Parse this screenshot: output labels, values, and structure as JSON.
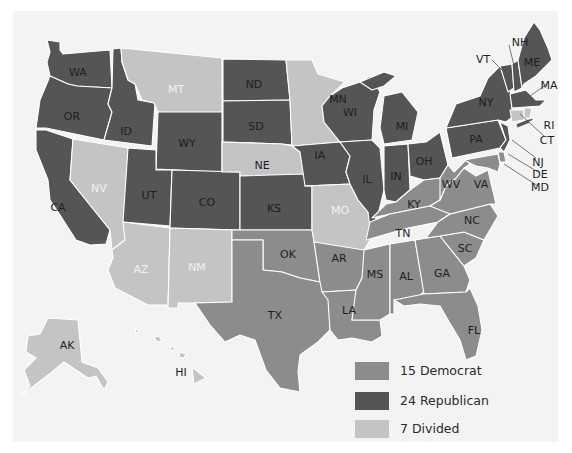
{
  "colors": {
    "democrat": "#8c8c8c",
    "republican": "#555555",
    "divided": "#c4c4c4",
    "panel": "#f3f3f3",
    "label_dark": "#1e1e1e",
    "label_light": "#f2f2f2"
  },
  "legend": {
    "items": [
      {
        "key": "democrat",
        "label": "15 Democrat",
        "color": "#8c8c8c"
      },
      {
        "key": "republican",
        "label": "24 Republican",
        "color": "#555555"
      },
      {
        "key": "divided",
        "label": "7 Divided",
        "color": "#c4c4c4"
      }
    ]
  },
  "states": [
    {
      "abbr": "WA",
      "party": "republican",
      "poly": "47,40 60,42 60,50 63,54 110,50 112,88 77,86 68,84 50,76 47,62 50,52",
      "lx": 78,
      "ly": 72
    },
    {
      "abbr": "OR",
      "party": "republican",
      "poly": "50,76 68,84 77,86 112,88 108,104 112,112 104,140 46,128 36,128 40,100",
      "lx": 72,
      "ly": 115
    },
    {
      "abbr": "CA",
      "party": "republican",
      "poly": "36,130 46,130 73,139 70,180 110,230 106,244 90,245 76,240 60,215 50,200 48,180 40,160 36,150",
      "lx": 58,
      "ly": 207
    },
    {
      "abbr": "ID",
      "party": "republican",
      "poly": "113,49 121,48 122,62 128,80 135,84 138,100 155,103 152,146 104,140 112,112 108,104 112,88",
      "lx": 124,
      "ly": 131
    },
    {
      "abbr": "NV",
      "party": "divided",
      "poly": "73,139 128,148 125,240 112,250 110,230 70,180",
      "lx": 98,
      "ly": 188
    },
    {
      "abbr": "MT",
      "party": "divided",
      "poly": "121,48 222,58 222,118 158,112 154,103 142,100 135,84 128,80 122,62",
      "lx": 176,
      "ly": 88
    },
    {
      "abbr": "WY",
      "party": "republican",
      "poly": "158,112 222,112 222,172 156,169",
      "lx": 186,
      "ly": 142
    },
    {
      "abbr": "UT",
      "party": "republican",
      "poly": "128,148 156,150 156,170 172,170 170,226 123,222",
      "lx": 149,
      "ly": 194
    },
    {
      "abbr": "CO",
      "party": "republican",
      "poly": "172,170 240,172 240,230 170,228",
      "lx": 205,
      "ly": 202
    },
    {
      "abbr": "AZ",
      "party": "divided",
      "poly": "123,222 170,228 168,305 148,305 115,288 108,270 113,258 112,250 125,240",
      "lx": 140,
      "ly": 268
    },
    {
      "abbr": "NM",
      "party": "divided",
      "poly": "170,228 232,230 232,302 195,303 178,303 178,308 168,308",
      "lx": 196,
      "ly": 266
    },
    {
      "abbr": "ND",
      "party": "republican",
      "poly": "223,59 286,60 290,100 223,101",
      "lx": 254,
      "ly": 84
    },
    {
      "abbr": "SD",
      "party": "republican",
      "poly": "223,101 290,100 292,145 282,144 223,142",
      "lx": 256,
      "ly": 124
    },
    {
      "abbr": "NE",
      "party": "divided",
      "poly": "222,142 282,144 292,146 300,152 305,175 240,176 240,172 222,172",
      "lx": 262,
      "ly": 164
    },
    {
      "abbr": "KS",
      "party": "republican",
      "poly": "240,176 305,174 312,186 312,230 240,230",
      "lx": 273,
      "ly": 207
    },
    {
      "abbr": "OK",
      "party": "democrat",
      "poly": "232,230 312,230 314,240 320,282 300,278 282,272 263,270 263,240 232,240",
      "lx": 287,
      "ly": 254
    },
    {
      "abbr": "TX",
      "party": "democrat",
      "poly": "232,240 263,240 263,270 282,272 300,278 320,282 328,282 330,330 318,342 300,355 298,372 300,392 280,388 266,370 255,340 240,335 225,342 210,325 195,303 232,302",
      "lx": 272,
      "ly": 312
    },
    {
      "abbr": "MN",
      "party": "divided",
      "poly": "286,60 312,60 318,74 345,82 330,96 322,106 324,122 340,142 292,146 290,100",
      "lx": 338,
      "ly": 96
    },
    {
      "abbr": "IA",
      "party": "republican",
      "poly": "292,146 340,142 350,156 346,172 350,184 305,186 300,152",
      "lx": 320,
      "ly": 162
    },
    {
      "abbr": "MO",
      "party": "divided",
      "poly": "305,186 350,184 358,200 368,212 372,228 370,240 364,250 320,252 314,242 312,230 312,186",
      "lx": 336,
      "ly": 214
    },
    {
      "abbr": "AR",
      "party": "democrat",
      "poly": "314,242 364,250 372,250 362,278 356,290 322,292 320,282",
      "lx": 339,
      "ly": 268
    },
    {
      "abbr": "LA",
      "party": "democrat",
      "poly": "322,292 356,290 356,302 352,320 380,320 382,336 372,342 352,338 338,340 330,330 328,300",
      "lx": 347,
      "ly": 315
    },
    {
      "abbr": "WI",
      "party": "republican",
      "poly": "330,96 342,88 360,82 370,76 380,92 374,110 372,140 340,142 324,122 322,106",
      "lx": 353,
      "ly": 113
    },
    {
      "abbr": "IL",
      "party": "republican",
      "poly": "340,142 372,140 380,148 384,190 378,215 370,228 368,212 358,200 350,184 346,172 350,156",
      "lx": 367,
      "ly": 185
    },
    {
      "abbr": "MI",
      "party": "republican",
      "poly": "384,96 402,92 418,112 412,140 384,144 380,128",
      "lx": 401,
      "ly": 124
    },
    {
      "abbr": "IN",
      "party": "republican",
      "poly": "384,146 408,144 410,190 396,202 386,200 384,190",
      "lx": 396,
      "ly": 177
    },
    {
      "abbr": "OH",
      "party": "republican",
      "poly": "408,144 426,142 440,132 448,165 440,178 424,180 410,176",
      "lx": 425,
      "ly": 162
    },
    {
      "abbr": "KY",
      "party": "democrat",
      "poly": "386,204 396,202 410,190 424,180 440,178 446,186 440,200 430,206 390,214 372,218",
      "lx": 414,
      "ly": 202
    },
    {
      "abbr": "TN",
      "party": "democrat",
      "poly": "370,222 390,214 430,206 458,202 450,214 438,222 408,228 366,240",
      "lx": 403,
      "ly": 231
    },
    {
      "abbr": "MS",
      "party": "democrat",
      "poly": "364,250 390,244 390,314 380,320 352,320 356,290 362,278",
      "lx": 375,
      "ly": 279
    },
    {
      "abbr": "AL",
      "party": "democrat",
      "poly": "390,244 415,240 424,292 416,298 394,300 394,314 390,314",
      "lx": 406,
      "ly": 275
    },
    {
      "abbr": "GA",
      "party": "democrat",
      "poly": "415,240 440,236 464,266 470,280 466,292 424,294",
      "lx": 442,
      "ly": 273
    },
    {
      "abbr": "FL",
      "party": "democrat",
      "poly": "394,300 424,294 466,292 470,288 478,306 482,330 476,356 466,360 460,340 448,320 440,306 420,304 404,306",
      "lx": 473,
      "ly": 330
    },
    {
      "abbr": "SC",
      "party": "democrat",
      "poly": "440,236 464,232 484,240 476,258 464,266",
      "lx": 465,
      "ly": 247
    },
    {
      "abbr": "NC",
      "party": "democrat",
      "poly": "438,222 450,214 490,204 498,216 484,240 464,232 440,236 426,238",
      "lx": 472,
      "ly": 220
    },
    {
      "abbr": "VA",
      "party": "democrat",
      "poly": "440,200 446,186 456,178 464,168 476,176 488,170 496,204 490,204 450,214 430,206",
      "lx": 475,
      "ly": 190
    },
    {
      "abbr": "WV",
      "party": "democrat",
      "poly": "440,178 448,165 454,172 466,160 470,164 464,168 456,178 446,186 440,200",
      "lx": 452,
      "ly": 186
    },
    {
      "abbr": "PA",
      "party": "republican",
      "poly": "446,128 498,120 506,140 500,148 452,158",
      "lx": 476,
      "ly": 138
    },
    {
      "abbr": "NY",
      "party": "republican",
      "poly": "456,104 480,96 488,78 500,66 508,64 512,110 516,114 506,122 498,120 446,128",
      "lx": 486,
      "ly": 101
    },
    {
      "abbr": "NJ",
      "party": "republican",
      "poly": "500,122 508,126 510,140 504,152 500,148 506,140",
      "lx": 0,
      "ly": 0
    },
    {
      "abbr": "DE",
      "party": "democrat",
      "poly": "498,152 504,152 506,162 500,162",
      "lx": 0,
      "ly": 0
    },
    {
      "abbr": "MD",
      "party": "democrat",
      "poly": "464,160 498,154 500,164 498,172 488,168 476,166",
      "lx": 0,
      "ly": 0
    },
    {
      "abbr": "VT",
      "party": "republican",
      "poly": "500,66 512,64 514,88 508,92",
      "lx": 0,
      "ly": 0
    },
    {
      "abbr": "NH",
      "party": "republican",
      "poly": "512,64 518,60 522,88 514,92",
      "lx": 0,
      "ly": 0
    },
    {
      "abbr": "ME",
      "party": "republican",
      "poly": "518,60 524,38 534,22 540,30 548,48 552,60 536,76 524,84 522,88",
      "lx": 530,
      "ly": 60
    },
    {
      "abbr": "MA",
      "party": "republican",
      "poly": "510,94 526,90 536,100 546,100 540,106 512,108",
      "lx": 0,
      "ly": 0
    },
    {
      "abbr": "CT",
      "party": "divided",
      "poly": "510,110 524,110 524,120 512,122",
      "lx": 0,
      "ly": 0
    },
    {
      "abbr": "RI",
      "party": "divided",
      "poly": "524,108 532,108 530,118 524,118",
      "lx": 0,
      "ly": 0
    },
    {
      "abbr": "AK",
      "party": "divided",
      "poly": "48,318 78,320 82,362 98,368 108,382 104,390 96,376 88,378 64,362 52,372 22,395 30,386 24,370 36,358 26,352 28,336 40,334",
      "lx": 65,
      "ly": 345
    },
    {
      "abbr": "HI",
      "party": "divided",
      "poly": "192,367 206,378 194,384",
      "lx": 0,
      "ly": 0
    }
  ],
  "extra_shapes": [
    {
      "name": "hawaii-island-1",
      "party": "divided",
      "poly": "135,328 139,331 136,334"
    },
    {
      "name": "hawaii-island-2",
      "party": "divided",
      "poly": "154,336 160,337 162,342 156,341"
    },
    {
      "name": "hawaii-island-3",
      "party": "divided",
      "poly": "170,346 175,348 172,352"
    },
    {
      "name": "hawaii-island-4",
      "party": "divided",
      "poly": "180,352 186,354 184,358 179,357"
    },
    {
      "name": "upper-michigan",
      "party": "republican",
      "poly": "360,82 384,72 396,76 384,86 372,90"
    },
    {
      "name": "long-island",
      "party": "republican",
      "poly": "516,124 532,118 534,120 518,127"
    }
  ],
  "labels": [
    {
      "abbr": "WA",
      "x": 78,
      "y": 72,
      "tone": "dark"
    },
    {
      "abbr": "OR",
      "x": 72,
      "y": 116,
      "tone": "dark"
    },
    {
      "abbr": "CA",
      "x": 58,
      "y": 207,
      "tone": "dark"
    },
    {
      "abbr": "ID",
      "x": 126,
      "y": 131,
      "tone": "dark"
    },
    {
      "abbr": "NV",
      "x": 99,
      "y": 188,
      "tone": "light"
    },
    {
      "abbr": "MT",
      "x": 176,
      "y": 89,
      "tone": "light"
    },
    {
      "abbr": "WY",
      "x": 187,
      "y": 143,
      "tone": "dark"
    },
    {
      "abbr": "UT",
      "x": 149,
      "y": 195,
      "tone": "dark"
    },
    {
      "abbr": "CO",
      "x": 207,
      "y": 202,
      "tone": "dark"
    },
    {
      "abbr": "AZ",
      "x": 141,
      "y": 269,
      "tone": "light"
    },
    {
      "abbr": "NM",
      "x": 197,
      "y": 267,
      "tone": "light"
    },
    {
      "abbr": "ND",
      "x": 254,
      "y": 84,
      "tone": "dark"
    },
    {
      "abbr": "SD",
      "x": 256,
      "y": 126,
      "tone": "dark"
    },
    {
      "abbr": "NE",
      "x": 262,
      "y": 165,
      "tone": "dark"
    },
    {
      "abbr": "KS",
      "x": 274,
      "y": 208,
      "tone": "dark"
    },
    {
      "abbr": "OK",
      "x": 288,
      "y": 254,
      "tone": "dark"
    },
    {
      "abbr": "TX",
      "x": 275,
      "y": 315,
      "tone": "dark"
    },
    {
      "abbr": "MN",
      "x": 338,
      "y": 99,
      "tone": "dark"
    },
    {
      "abbr": "IA",
      "x": 320,
      "y": 155,
      "tone": "dark"
    },
    {
      "abbr": "MO",
      "x": 340,
      "y": 210,
      "tone": "light"
    },
    {
      "abbr": "AR",
      "x": 339,
      "y": 258,
      "tone": "dark"
    },
    {
      "abbr": "LA",
      "x": 349,
      "y": 310,
      "tone": "dark"
    },
    {
      "abbr": "WI",
      "x": 350,
      "y": 112,
      "tone": "dark"
    },
    {
      "abbr": "IL",
      "x": 367,
      "y": 179,
      "tone": "dark"
    },
    {
      "abbr": "MI",
      "x": 402,
      "y": 126,
      "tone": "dark"
    },
    {
      "abbr": "IN",
      "x": 396,
      "y": 176,
      "tone": "dark"
    },
    {
      "abbr": "OH",
      "x": 424,
      "y": 161,
      "tone": "dark"
    },
    {
      "abbr": "KY",
      "x": 414,
      "y": 204,
      "tone": "dark"
    },
    {
      "abbr": "TN",
      "x": 403,
      "y": 233,
      "tone": "dark"
    },
    {
      "abbr": "MS",
      "x": 375,
      "y": 274,
      "tone": "dark"
    },
    {
      "abbr": "AL",
      "x": 406,
      "y": 276,
      "tone": "dark"
    },
    {
      "abbr": "GA",
      "x": 442,
      "y": 273,
      "tone": "dark"
    },
    {
      "abbr": "FL",
      "x": 474,
      "y": 330,
      "tone": "dark"
    },
    {
      "abbr": "SC",
      "x": 465,
      "y": 248,
      "tone": "dark"
    },
    {
      "abbr": "NC",
      "x": 472,
      "y": 220,
      "tone": "dark"
    },
    {
      "abbr": "VA",
      "x": 481,
      "y": 184,
      "tone": "dark"
    },
    {
      "abbr": "WV",
      "x": 451,
      "y": 184,
      "tone": "dark"
    },
    {
      "abbr": "PA",
      "x": 476,
      "y": 139,
      "tone": "dark"
    },
    {
      "abbr": "NY",
      "x": 486,
      "y": 102,
      "tone": "dark"
    },
    {
      "abbr": "ME",
      "x": 532,
      "y": 62,
      "tone": "dark"
    },
    {
      "abbr": "AK",
      "x": 67,
      "y": 345,
      "tone": "dark"
    },
    {
      "abbr": "HI",
      "x": 181,
      "y": 372,
      "tone": "dark"
    }
  ],
  "callouts": [
    {
      "abbr": "NH",
      "x": 520,
      "y": 42,
      "lx1": 509,
      "ly1": 45,
      "lx2": 518,
      "ly2": 82
    },
    {
      "abbr": "VT",
      "x": 483,
      "y": 59,
      "lx1": 492,
      "ly1": 60,
      "lx2": 510,
      "ly2": 78
    },
    {
      "abbr": "MA",
      "x": 549,
      "y": 85,
      "lx1": 547,
      "ly1": 84,
      "lx2": 530,
      "ly2": 96
    },
    {
      "abbr": "RI",
      "x": 549,
      "y": 125,
      "lx1": 0,
      "ly1": 0,
      "lx2": 0,
      "ly2": 0
    },
    {
      "abbr": "CT",
      "x": 547,
      "y": 140,
      "lx1": 544,
      "ly1": 136,
      "lx2": 520,
      "ly2": 114
    },
    {
      "abbr": "NJ",
      "x": 538,
      "y": 162,
      "lx1": 536,
      "ly1": 158,
      "lx2": 512,
      "ly2": 140
    },
    {
      "abbr": "DE",
      "x": 540,
      "y": 174,
      "lx1": 538,
      "ly1": 172,
      "lx2": 508,
      "ly2": 154
    },
    {
      "abbr": "MD",
      "x": 540,
      "y": 187,
      "lx1": 538,
      "ly1": 186,
      "lx2": 504,
      "ly2": 164
    }
  ],
  "ri_marker": {
    "x1": 517,
    "y1": 126,
    "x2": 529,
    "y2": 121
  }
}
